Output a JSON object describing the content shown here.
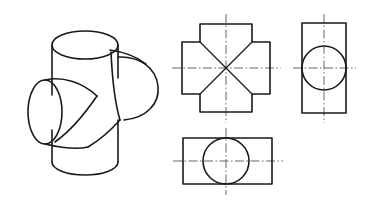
{
  "drawing": {
    "title": "Three Intersecting Cylinders",
    "description": "Isometric pictorial view with three orthographic projection views",
    "background_color": "#ffffff",
    "object_line_color": "#1a1a1a",
    "center_line_color": "#555555",
    "object_line_width": 1.6,
    "center_line_width": 0.9,
    "canvas": {
      "width": 376,
      "height": 207
    }
  },
  "isometric": {
    "label": "isometric-pictorial-view",
    "caption": "Three equal-diameter cylinders intersecting mutually at right angles",
    "parts": [
      {
        "name": "vertical-cylinder",
        "axis": "vertical"
      },
      {
        "name": "front-left-cylinder",
        "axis": "horizontal-left"
      },
      {
        "name": "rear-right-cylinder",
        "axis": "horizontal-right"
      }
    ],
    "geometry": {
      "vertical_top_ellipse": {
        "cx": 85,
        "cy": 45,
        "rx": 33,
        "ry": 14
      },
      "vertical_bottom_arc": {
        "cx": 85,
        "cy": 162,
        "rx": 33,
        "ry": 13
      },
      "vertical_left_edge_x": 52,
      "vertical_right_edge_x": 118,
      "front_cylinder_ellipse": {
        "cx": 45,
        "cy": 112,
        "rx": 17,
        "ry": 32
      },
      "right_cylinder_ellipse": {
        "cx": 150,
        "cy": 84,
        "rx": 14,
        "ry": 30
      }
    }
  },
  "views": {
    "front_view": {
      "label": "front-view-cross-shape",
      "type": "cross",
      "note": "Plus/cross outline with four diagonal intersection lines meeting at center",
      "center": {
        "x": 226,
        "y": 68
      },
      "outer_half_width": 44,
      "arm_half_width": 26,
      "diagonal_count": 4,
      "has_horizontal_centerline": true,
      "has_vertical_centerline": true
    },
    "side_view": {
      "label": "right-side-view",
      "type": "rectangle-with-circle",
      "rect": {
        "x": 302,
        "y": 23,
        "width": 44,
        "height": 90
      },
      "circle": {
        "cx": 324,
        "cy": 68,
        "r": 22
      },
      "note": "Circle inscribed touching left and right edges of the tall rectangle",
      "has_horizontal_centerline": true,
      "has_vertical_centerline": true
    },
    "top_view": {
      "label": "top-view",
      "type": "rectangle-with-circle",
      "rect": {
        "x": 183,
        "y": 138,
        "width": 89,
        "height": 46
      },
      "circle": {
        "cx": 226,
        "cy": 161,
        "r": 23
      },
      "note": "Circle inscribed touching top and bottom edges of the wide rectangle",
      "has_horizontal_centerline": true,
      "has_vertical_centerline": true
    }
  }
}
